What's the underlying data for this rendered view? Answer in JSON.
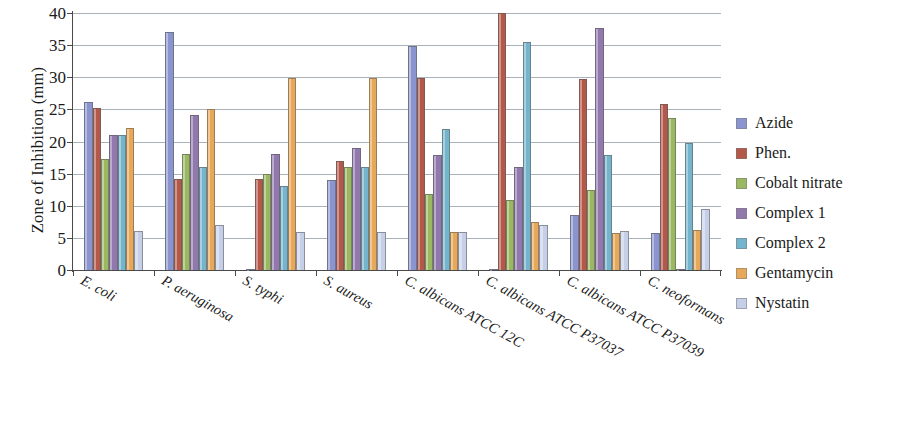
{
  "chart_data": {
    "type": "bar",
    "title": "",
    "xlabel": "",
    "ylabel": "Zone of Inhibition (mm)",
    "ylim": [
      0,
      40
    ],
    "ytick_labels": [
      "0",
      "5",
      "10",
      "15",
      "20",
      "25",
      "30",
      "35",
      "40"
    ],
    "yticks": [
      0,
      5,
      10,
      15,
      20,
      25,
      30,
      35,
      40
    ],
    "grid": true,
    "legend_position": "right",
    "categories": [
      "E. coli",
      "P. aeruginosa",
      "S. typhi",
      "S.  aureus",
      "C. albicans ATCC 12C",
      "C. albicans ATCC P37037",
      "C. albicans ATCC P37039",
      "C. neoformans"
    ],
    "series": [
      {
        "name": "Azide",
        "color": "#8a95cf",
        "values": [
          26.1,
          37.1,
          0.2,
          14.0,
          34.8,
          0.2,
          8.5,
          5.7
        ]
      },
      {
        "name": "Phen.",
        "color": "#b4584a",
        "values": [
          25.2,
          14.2,
          14.1,
          17.0,
          29.9,
          40.0,
          29.8,
          25.8
        ]
      },
      {
        "name": "Cobalt nitrate",
        "color": "#99b861",
        "values": [
          17.3,
          18.1,
          15.0,
          16.0,
          11.8,
          10.9,
          12.5,
          23.7
        ]
      },
      {
        "name": "Complex 1",
        "color": "#9178ad",
        "values": [
          21.0,
          24.1,
          18.0,
          19.0,
          17.9,
          16.0,
          37.7,
          0.2
        ]
      },
      {
        "name": "Complex 2",
        "color": "#74b4cc",
        "values": [
          21.0,
          16.0,
          13.0,
          16.0,
          22.0,
          35.5,
          17.9,
          19.8
        ]
      },
      {
        "name": "Gentamycin",
        "color": "#e8a85a",
        "values": [
          22.1,
          25.1,
          29.9,
          29.9,
          5.9,
          7.5,
          5.8,
          6.2
        ]
      },
      {
        "name": "Nystatin",
        "color": "#c5cfe8",
        "values": [
          6.0,
          7.0,
          5.9,
          5.9,
          5.9,
          7.0,
          6.0,
          9.5
        ]
      }
    ]
  },
  "axis": {
    "y_title": "Zone of Inhibition (mm)"
  }
}
